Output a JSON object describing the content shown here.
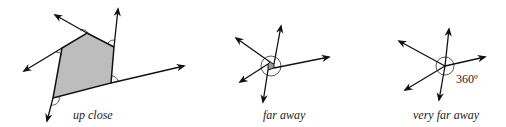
{
  "figures": [
    {
      "id": "up-close",
      "caption": "up close"
    },
    {
      "id": "far-away",
      "caption": "far away"
    },
    {
      "id": "very-far-away",
      "caption": "very far away",
      "angle_label": "360º"
    }
  ],
  "colors": {
    "stroke": "#111111",
    "fill": "#bdbdbd",
    "background": "#ffffff"
  }
}
